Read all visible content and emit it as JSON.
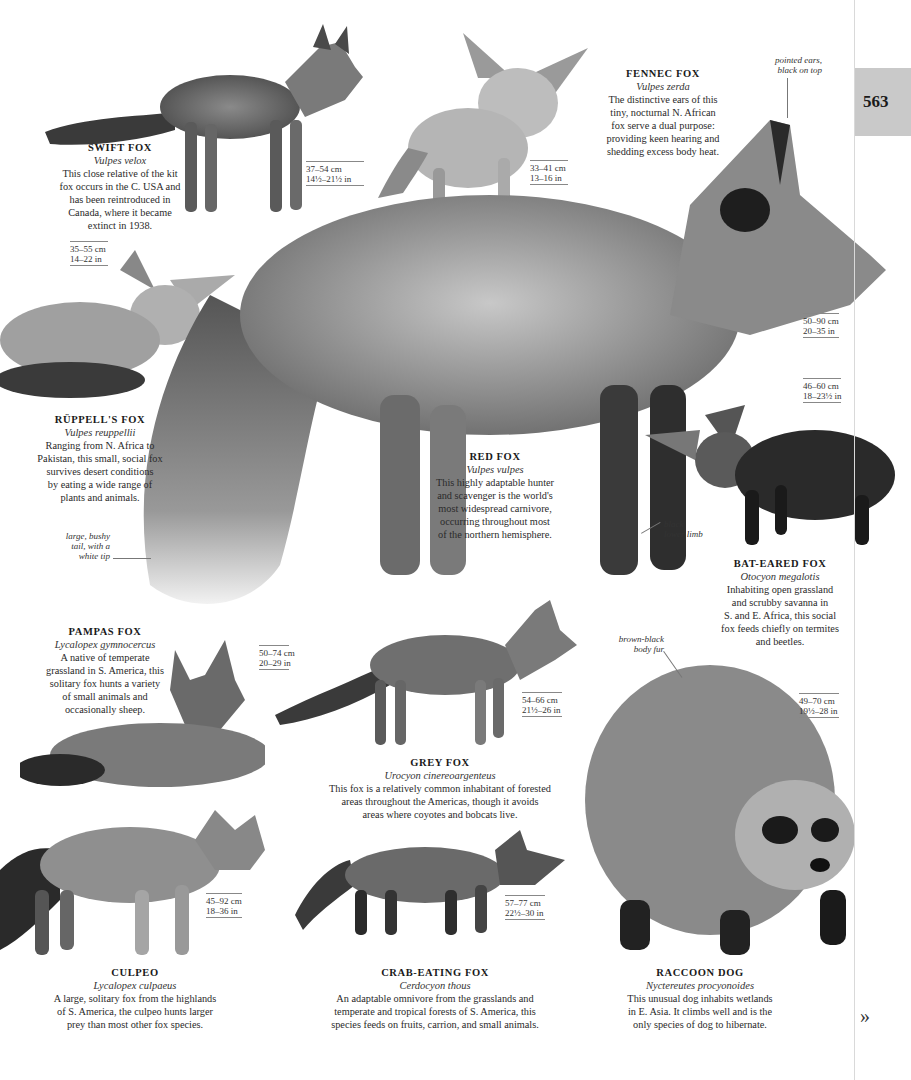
{
  "page": {
    "number": "563",
    "next_label": "»"
  },
  "species": [
    {
      "id": "swift-fox",
      "name": "SWIFT FOX",
      "latin": "Vulpes velox",
      "description": [
        "This close relative of the kit",
        "fox occurs in the C. USA and",
        "has been reintroduced in",
        "Canada, where it became",
        "extinct in 1938."
      ],
      "size_cm": "37–54 cm",
      "size_in": "14½–21½ in"
    },
    {
      "id": "fennec-fox",
      "name": "FENNEC FOX",
      "latin": "Vulpes zerda",
      "description": [
        "The distinctive ears of this",
        "tiny, nocturnal N. African",
        "fox serve a dual purpose:",
        "providing keen hearing and",
        "shedding excess body heat."
      ],
      "size_cm": "33–41 cm",
      "size_in": "13–16 in"
    },
    {
      "id": "ruppells-fox",
      "name": "RÜPPELL'S FOX",
      "latin": "Vulpes reuppellii",
      "description": [
        "Ranging from N. Africa to",
        "Pakistan, this small, social fox",
        "survives desert conditions",
        "by eating a wide range of",
        "plants and animals."
      ],
      "size_cm": "35–55 cm",
      "size_in": "14–22 in"
    },
    {
      "id": "red-fox",
      "name": "RED FOX",
      "latin": "Vulpes vulpes",
      "description": [
        "This highly adaptable hunter",
        "and scavenger is the world's",
        "most widespread carnivore,",
        "occurring throughout most",
        "of the northern hemisphere."
      ],
      "size_cm": "50–90 cm",
      "size_in": "20–35 in"
    },
    {
      "id": "bat-eared-fox",
      "name": "BAT-EARED FOX",
      "latin": "Otocyon megalotis",
      "description": [
        "Inhabiting open grassland",
        "and scrubby savanna in",
        "S. and E. Africa, this social",
        "fox feeds chiefly on termites",
        "and beetles."
      ],
      "size_cm": "46–60 cm",
      "size_in": "18–23½ in"
    },
    {
      "id": "pampas-fox",
      "name": "PAMPAS FOX",
      "latin": "Lycalopex gymnocercus",
      "description": [
        "A native of temperate",
        "grassland in S. America, this",
        "solitary fox hunts a variety",
        "of small animals and",
        "occasionally sheep."
      ],
      "size_cm": "50–74 cm",
      "size_in": "20–29 in"
    },
    {
      "id": "grey-fox",
      "name": "GREY FOX",
      "latin": "Urocyon cinereoargenteus",
      "description": [
        "This fox is a relatively common inhabitant of forested",
        "areas throughout the Americas, though it avoids",
        "areas where coyotes and bobcats live."
      ],
      "size_cm": "54–66 cm",
      "size_in": "21½–26 in"
    },
    {
      "id": "raccoon-dog",
      "name": "RACCOON DOG",
      "latin": "Nyctereutes procyonoides",
      "description": [
        "This unusual dog inhabits wetlands",
        "in E. Asia. It climbs well and is the",
        "only species of dog to hibernate."
      ],
      "size_cm": "49–70 cm",
      "size_in": "19½–28 in"
    },
    {
      "id": "culpeo",
      "name": "CULPEO",
      "latin": "Lycalopex culpaeus",
      "description": [
        "A large, solitary fox from the highlands",
        "of S. America, the culpeo hunts larger",
        "prey than most other fox species."
      ],
      "size_cm": "45–92 cm",
      "size_in": "18–36 in"
    },
    {
      "id": "crab-eating-fox",
      "name": "CRAB-EATING FOX",
      "latin": "Cerdocyon thous",
      "description": [
        "An adaptable omnivore from the grasslands and",
        "temperate and tropical forests of S. America, this",
        "species feeds on fruits, carrion, and small animals."
      ],
      "size_cm": "57–77 cm",
      "size_in": "22½–30 in"
    }
  ],
  "annotations": {
    "ears": [
      "pointed ears,",
      "black on top"
    ],
    "tail": [
      "large, bushy",
      "tail, with a",
      "white tip"
    ],
    "limb": [
      "black",
      "lower limb"
    ],
    "fur": [
      "brown-black",
      "body fur"
    ]
  },
  "colors": {
    "page_tab": "#c9c9c9",
    "text": "#222222",
    "rule": "#888888"
  }
}
